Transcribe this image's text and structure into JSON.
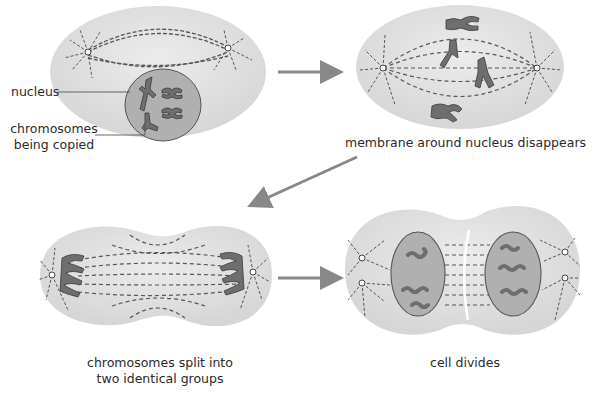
{
  "diagram": {
    "stages": [
      {
        "id": "stage-1",
        "callouts": [
          {
            "label": "nucleus"
          },
          {
            "label_line1": "chromosomes",
            "label_line2": "being copied"
          }
        ]
      },
      {
        "id": "stage-2",
        "caption": "membrane around nucleus disappears"
      },
      {
        "id": "stage-3",
        "caption_line1": "chromosomes split into",
        "caption_line2": "two identical groups"
      },
      {
        "id": "stage-4",
        "caption": "cell divides"
      }
    ],
    "arrows": [
      {
        "from": "stage-1",
        "to": "stage-2",
        "direction": "right"
      },
      {
        "from": "stage-2",
        "to": "stage-3",
        "direction": "down-left"
      },
      {
        "from": "stage-3",
        "to": "stage-4",
        "direction": "right"
      }
    ],
    "colors": {
      "cell_fill": "#e2e2e2",
      "cell_edge": "#cfcfcf",
      "nucleus_fill": "#b0b0b0",
      "nucleus_edge": "#555555",
      "chromosome": "#6e6e6e",
      "chromosome_edge": "#3a3a3a",
      "spindle": "#555555",
      "arrow": "#888888",
      "text": "#2a2a2a"
    }
  }
}
